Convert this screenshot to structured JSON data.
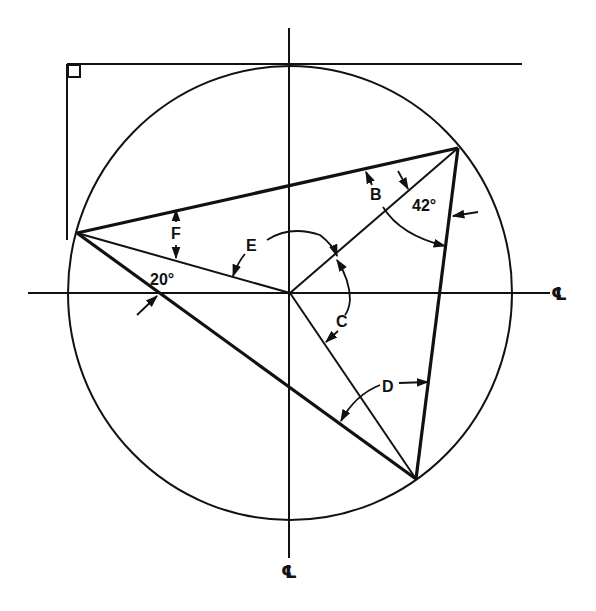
{
  "diagram": {
    "colors": {
      "ink": "#111111",
      "background": "#ffffff"
    },
    "circle": {
      "cx": 290,
      "cy": 293,
      "rx": 222,
      "ry": 227
    },
    "centerline_symbol": "℄",
    "centerline_labels": {
      "horizontal": "CL",
      "vertical": "CL"
    },
    "vertices": {
      "left": {
        "x": 77,
        "y": 233
      },
      "top_right": {
        "x": 458,
        "y": 148
      },
      "bottom": {
        "x": 416,
        "y": 479
      },
      "center": {
        "x": 290,
        "y": 293
      }
    },
    "angle_labels": [
      {
        "id": "B",
        "text": "B",
        "x": 370,
        "y": 200
      },
      {
        "id": "42",
        "text": "42°",
        "x": 412,
        "y": 211
      },
      {
        "id": "C",
        "text": "C",
        "x": 336,
        "y": 327
      },
      {
        "id": "D",
        "text": "D",
        "x": 382,
        "y": 392
      },
      {
        "id": "E",
        "text": "E",
        "x": 246,
        "y": 251
      },
      {
        "id": "F",
        "text": "F",
        "x": 172,
        "y": 238
      },
      {
        "id": "20",
        "text": "20°",
        "x": 150,
        "y": 285
      }
    ],
    "right_angle_marker": true
  }
}
